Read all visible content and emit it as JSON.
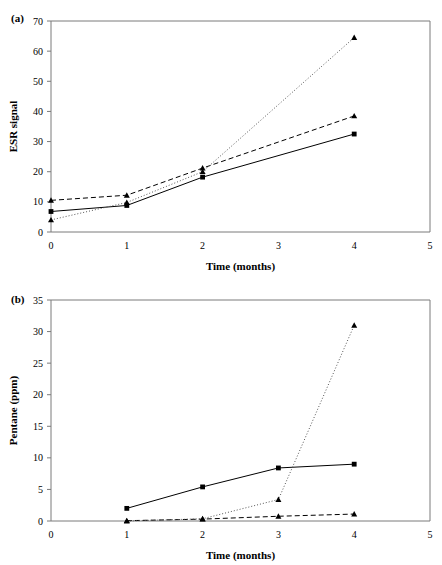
{
  "figure": {
    "panels": [
      {
        "label": "(a)",
        "xlabel": "Time (months)",
        "ylabel": "ESR signal"
      },
      {
        "label": "(b)",
        "xlabel": "Time (months)",
        "ylabel": "Pentane (ppm)"
      }
    ]
  },
  "chart_data": [
    {
      "type": "line",
      "panel": "(a)",
      "title": "",
      "xlabel": "Time (months)",
      "ylabel": "ESR signal",
      "xlim": [
        0,
        5
      ],
      "ylim": [
        0,
        70
      ],
      "xticks": [
        0,
        1,
        2,
        3,
        4,
        5
      ],
      "yticks": [
        0,
        10,
        20,
        30,
        40,
        50,
        60,
        70
      ],
      "xticklabels": [
        "0",
        "1",
        "2",
        "3",
        "4",
        "5"
      ],
      "yticklabels": [
        "0",
        "10",
        "20",
        "30",
        "40",
        "50",
        "60",
        "70"
      ],
      "grid": false,
      "legend": "none",
      "series": [
        {
          "name": "solid-square",
          "style": "solid",
          "marker": "square",
          "x": [
            0,
            1,
            2,
            4
          ],
          "values": [
            6.8,
            8.8,
            18.2,
            32.5
          ]
        },
        {
          "name": "dashed-triangle",
          "style": "dashed",
          "marker": "triangle",
          "x": [
            0,
            1,
            2,
            4
          ],
          "values": [
            10.5,
            12.2,
            21.2,
            38.5
          ]
        },
        {
          "name": "dotted-triangle",
          "style": "dotted",
          "marker": "triangle",
          "x": [
            0,
            1,
            2,
            4
          ],
          "values": [
            4.0,
            9.8,
            20.0,
            64.5
          ]
        }
      ]
    },
    {
      "type": "line",
      "panel": "(b)",
      "title": "",
      "xlabel": "Time (months)",
      "ylabel": "Pentane (ppm)",
      "xlim": [
        0,
        5
      ],
      "ylim": [
        0,
        35
      ],
      "xticks": [
        0,
        1,
        2,
        3,
        4,
        5
      ],
      "yticks": [
        0,
        5,
        10,
        15,
        20,
        25,
        30,
        35
      ],
      "xticklabels": [
        "0",
        "1",
        "2",
        "3",
        "4",
        "5"
      ],
      "yticklabels": [
        "0",
        "5",
        "10",
        "15",
        "20",
        "25",
        "30",
        "35"
      ],
      "grid": false,
      "legend": "none",
      "series": [
        {
          "name": "solid-square",
          "style": "solid",
          "marker": "square",
          "x": [
            1,
            2,
            3,
            4
          ],
          "values": [
            2.0,
            5.4,
            8.4,
            9.0
          ]
        },
        {
          "name": "dashed-triangle",
          "style": "dashed",
          "marker": "triangle",
          "x": [
            1,
            2,
            3,
            4
          ],
          "values": [
            0.05,
            0.3,
            0.75,
            1.1
          ]
        },
        {
          "name": "dotted-triangle",
          "style": "dotted",
          "marker": "triangle",
          "x": [
            1,
            2,
            3,
            4
          ],
          "values": [
            0.0,
            0.35,
            3.4,
            31.0
          ]
        }
      ]
    }
  ],
  "colors": {
    "axis": "#7a7a7a",
    "ink": "#000000",
    "dotted": "#555555",
    "background": "#ffffff"
  }
}
